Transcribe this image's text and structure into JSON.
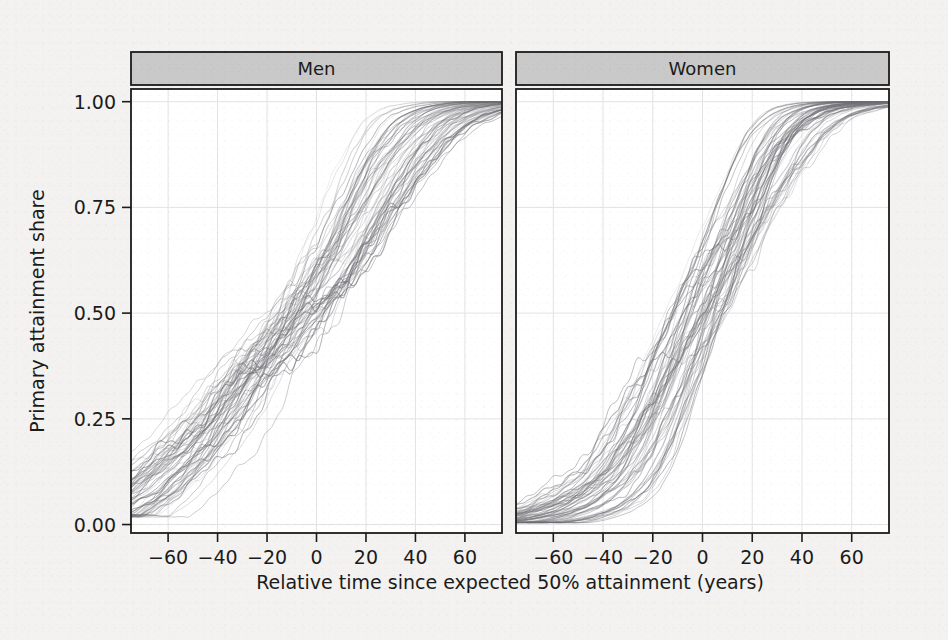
{
  "figure": {
    "background_color": "#f3f2f0",
    "panel_background_color": "#ffffff",
    "strip_background_color": "#c9c9c9",
    "line_color": "#6e6e74",
    "grid_color": "#e3e3e3",
    "axis_color": "#1b1b1b"
  },
  "chart_data": {
    "type": "line",
    "title": "",
    "subtitle": "",
    "xlabel": "Relative time since expected 50% attainment (years)",
    "ylabel": "Primary attainment share",
    "xlim": [
      -75,
      75
    ],
    "ylim": [
      -0.02,
      1.03
    ],
    "xticks": [
      -60,
      -40,
      -20,
      0,
      20,
      40,
      60
    ],
    "xticklabels": [
      "−60",
      "−40",
      "−20",
      "0",
      "20",
      "40",
      "60"
    ],
    "yticks": [
      0.0,
      0.25,
      0.5,
      0.75,
      1.0
    ],
    "yticklabels": [
      "0.00",
      "0.25",
      "0.50",
      "0.75",
      "1.00"
    ],
    "grid": true,
    "legend_position": "none",
    "facets": [
      {
        "label": "Men",
        "n_curves": 64,
        "description": "Spaghetti plot of country-level sigmoid attainment trajectories, aligned at expected 50% attainment.",
        "median_curve": {
          "x": [
            -75,
            -70,
            -65,
            -60,
            -55,
            -50,
            -45,
            -40,
            -35,
            -30,
            -25,
            -20,
            -15,
            -10,
            -5,
            0,
            5,
            10,
            15,
            20,
            25,
            30,
            35,
            40,
            45,
            50,
            55,
            60,
            65,
            70,
            75
          ],
          "y": [
            0.02,
            0.04,
            0.06,
            0.08,
            0.11,
            0.14,
            0.17,
            0.21,
            0.25,
            0.29,
            0.34,
            0.38,
            0.42,
            0.46,
            0.5,
            0.54,
            0.59,
            0.64,
            0.7,
            0.76,
            0.82,
            0.87,
            0.91,
            0.945,
            0.965,
            0.978,
            0.987,
            0.992,
            0.996,
            0.998,
            1.0
          ]
        },
        "spread": {
          "x_jitter_years": 12,
          "y_band_at_midpoint": [
            0.4,
            0.62
          ],
          "start_value_range": [
            0.0,
            0.12
          ],
          "end_value_range": [
            0.97,
            1.0
          ]
        }
      },
      {
        "label": "Women",
        "n_curves": 64,
        "description": "Spaghetti plot of country-level sigmoid attainment trajectories, aligned at expected 50% attainment; lower left tail and steeper rise than men.",
        "median_curve": {
          "x": [
            -75,
            -70,
            -65,
            -60,
            -55,
            -50,
            -45,
            -40,
            -35,
            -30,
            -25,
            -20,
            -15,
            -10,
            -5,
            0,
            5,
            10,
            15,
            20,
            25,
            30,
            35,
            40,
            45,
            50,
            55,
            60,
            65,
            70,
            75
          ],
          "y": [
            0.005,
            0.008,
            0.012,
            0.018,
            0.026,
            0.036,
            0.05,
            0.07,
            0.095,
            0.13,
            0.18,
            0.24,
            0.31,
            0.39,
            0.46,
            0.53,
            0.6,
            0.67,
            0.74,
            0.81,
            0.875,
            0.925,
            0.955,
            0.975,
            0.986,
            0.992,
            0.996,
            0.998,
            0.999,
            1.0,
            1.0
          ]
        },
        "spread": {
          "x_jitter_years": 11,
          "y_band_at_midpoint": [
            0.42,
            0.64
          ],
          "start_value_range": [
            0.0,
            0.04
          ],
          "end_value_range": [
            0.98,
            1.0
          ]
        }
      }
    ]
  }
}
